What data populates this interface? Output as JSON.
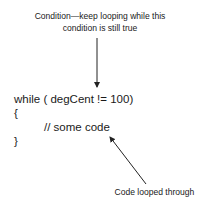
{
  "annotations": {
    "condition_label_line1": "Condition—keep looping while this",
    "condition_label_line2": "condition is still true",
    "body_label": "Code looped through"
  },
  "code": {
    "lines": [
      "while ( degCent != 100)",
      "{",
      "// some code",
      "}"
    ]
  },
  "colors": {
    "text": "#1a1a1a",
    "arrow": "#222222",
    "background": "#ffffff"
  }
}
